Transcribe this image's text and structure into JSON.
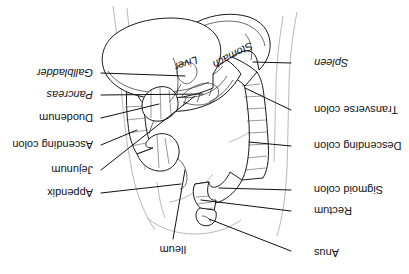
{
  "figure": {
    "orientation": "rotated-180",
    "background_color": "#ffffff",
    "line_color": "#1a1a1a",
    "body_outline_color": "#b9b9b9",
    "label_color": "#121212"
  },
  "labels": [
    {
      "id": "anus",
      "text": "Anus",
      "style": "regular",
      "side": "left",
      "x": 95,
      "y": 22
    },
    {
      "id": "rectum",
      "text": "Rectum",
      "style": "regular",
      "side": "left",
      "x": 91,
      "y": 66
    },
    {
      "id": "sigmoid-colon",
      "text": "Sigmoid colon",
      "style": "regular",
      "side": "left",
      "x": 91,
      "y": 87
    },
    {
      "id": "descending-colon",
      "text": "Descending colon",
      "style": "regular",
      "side": "left",
      "x": 91,
      "y": 131
    },
    {
      "id": "transverse-colon",
      "text": "Transverse colon",
      "style": "regular",
      "side": "left",
      "x": 91,
      "y": 167
    },
    {
      "id": "spleen",
      "text": "Spleen",
      "style": "italic",
      "side": "left",
      "x": 91,
      "y": 214
    },
    {
      "id": "ileum",
      "text": "Ileum",
      "style": "regular",
      "side": "top",
      "x": 236,
      "y": 25
    },
    {
      "id": "appendix",
      "text": "Appendix",
      "style": "regular",
      "side": "right",
      "x": 313,
      "y": 84
    },
    {
      "id": "jejunum",
      "text": "Jejunum",
      "style": "regular",
      "side": "right",
      "x": 313,
      "y": 107
    },
    {
      "id": "ascending-colon",
      "text": "Ascending colon",
      "style": "regular",
      "side": "right",
      "x": 313,
      "y": 132
    },
    {
      "id": "duodenum",
      "text": "Duodenum",
      "style": "regular",
      "side": "right",
      "x": 313,
      "y": 159
    },
    {
      "id": "pancreas",
      "text": "Pancreas",
      "style": "italic",
      "side": "right",
      "x": 313,
      "y": 182
    },
    {
      "id": "gallbladder",
      "text": "Gallbladder",
      "style": "italic",
      "side": "right",
      "x": 313,
      "y": 204
    },
    {
      "id": "liver",
      "text": "Liver",
      "style": "italic",
      "side": "inline",
      "x": 224,
      "y": 214
    },
    {
      "id": "stomach",
      "text": "Stomach",
      "style": "italic",
      "side": "inline",
      "x": 163,
      "y": 196
    }
  ]
}
